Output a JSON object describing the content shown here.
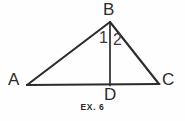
{
  "figure": {
    "caption": "EX. 6",
    "background_color": "#fefefe",
    "stroke_color": "#2b2b2b",
    "text_color": "#2b2b2b",
    "width": 185,
    "height": 121,
    "vertices": [
      {
        "id": "A",
        "label": "A",
        "x": 27,
        "y": 85,
        "label_x": 8,
        "label_y": 71
      },
      {
        "id": "B",
        "label": "B",
        "x": 110,
        "y": 22,
        "label_x": 103,
        "label_y": 1
      },
      {
        "id": "C",
        "label": "C",
        "x": 159,
        "y": 84,
        "label_x": 162,
        "label_y": 71
      },
      {
        "id": "D",
        "label": "D",
        "x": 110,
        "y": 85,
        "label_x": 104,
        "label_y": 86
      }
    ],
    "segments": [
      {
        "id": "AB",
        "from": "A",
        "to": "B",
        "x1": 27,
        "y1": 85,
        "x2": 110,
        "y2": 22
      },
      {
        "id": "BC",
        "from": "B",
        "to": "C",
        "x1": 110,
        "y1": 22,
        "x2": 159,
        "y2": 84
      },
      {
        "id": "AC",
        "from": "A",
        "to": "C",
        "x1": 27,
        "y1": 85,
        "x2": 159,
        "y2": 84
      },
      {
        "id": "BD",
        "from": "B",
        "to": "D",
        "x1": 110,
        "y1": 22,
        "x2": 110,
        "y2": 85
      }
    ],
    "angle_labels": [
      {
        "id": "1",
        "label": "1",
        "x": 99,
        "y": 30
      },
      {
        "id": "2",
        "label": "2",
        "x": 113,
        "y": 32
      }
    ]
  }
}
